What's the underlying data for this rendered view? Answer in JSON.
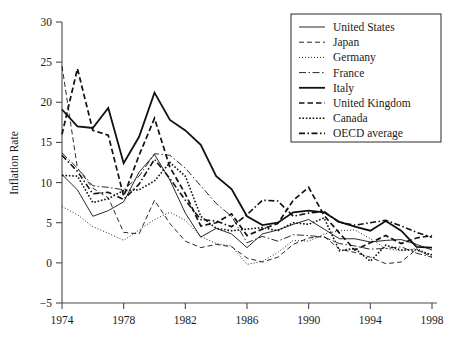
{
  "chart_data": {
    "type": "line",
    "title": "",
    "xlabel": "",
    "ylabel": "Inflation Rate",
    "xlim": [
      1974,
      1998
    ],
    "ylim": [
      -5,
      30
    ],
    "xticks": [
      1974,
      1978,
      1982,
      1986,
      1990,
      1994,
      1998
    ],
    "yticks": [
      -5,
      0,
      5,
      10,
      15,
      20,
      25,
      30
    ],
    "grid": false,
    "legend_position": "top-right",
    "x": [
      1974,
      1975,
      1976,
      1977,
      1978,
      1979,
      1980,
      1981,
      1982,
      1983,
      1984,
      1985,
      1986,
      1987,
      1988,
      1989,
      1990,
      1991,
      1992,
      1993,
      1994,
      1995,
      1996,
      1997,
      1998
    ],
    "series": [
      {
        "name": "United States",
        "style": "solid-thin",
        "stroke_width": 0.9,
        "dash": "none",
        "values": [
          11.0,
          9.1,
          5.8,
          6.5,
          7.6,
          11.3,
          13.5,
          10.3,
          6.2,
          3.2,
          4.3,
          3.6,
          1.9,
          3.6,
          4.1,
          4.8,
          5.4,
          4.2,
          3.0,
          3.0,
          2.6,
          2.8,
          2.9,
          2.3,
          1.6
        ]
      },
      {
        "name": "Japan",
        "style": "dashed-thin",
        "stroke_width": 0.9,
        "dash": "5,3",
        "values": [
          24.5,
          11.8,
          9.3,
          8.1,
          3.8,
          3.6,
          7.8,
          4.9,
          2.7,
          1.9,
          2.3,
          2.0,
          0.6,
          0.1,
          0.7,
          2.3,
          3.1,
          3.3,
          1.7,
          1.3,
          0.7,
          -0.1,
          0.1,
          1.7,
          0.7
        ]
      },
      {
        "name": "Germany",
        "style": "dotted-thin",
        "stroke_width": 0.9,
        "dash": "1,2",
        "values": [
          7.0,
          6.0,
          4.5,
          3.7,
          2.8,
          4.1,
          5.4,
          6.3,
          5.3,
          3.3,
          2.4,
          2.1,
          -0.2,
          0.2,
          1.3,
          2.8,
          2.7,
          3.6,
          4.0,
          4.1,
          3.0,
          1.8,
          1.5,
          1.8,
          0.9
        ]
      },
      {
        "name": "France",
        "style": "dash-dot-thin",
        "stroke_width": 0.9,
        "dash": "7,2.5,1.5,2.5",
        "values": [
          13.7,
          11.8,
          9.6,
          9.4,
          9.1,
          10.8,
          13.6,
          13.4,
          11.8,
          9.6,
          7.4,
          5.8,
          2.5,
          3.3,
          2.7,
          3.5,
          3.4,
          3.2,
          2.4,
          2.1,
          1.7,
          1.8,
          2.0,
          1.2,
          0.7
        ]
      },
      {
        "name": "Italy",
        "style": "solid-thick",
        "stroke_width": 1.8,
        "dash": "none",
        "values": [
          19.1,
          17.0,
          16.8,
          19.3,
          12.4,
          15.7,
          21.2,
          17.8,
          16.5,
          14.7,
          10.8,
          9.2,
          5.8,
          4.7,
          5.0,
          6.3,
          6.5,
          6.3,
          5.1,
          4.5,
          4.0,
          5.2,
          4.0,
          2.0,
          1.9
        ]
      },
      {
        "name": "United Kingdom",
        "style": "dashed-thick",
        "stroke_width": 1.7,
        "dash": "5.5,3",
        "values": [
          16.0,
          24.2,
          16.5,
          15.9,
          8.3,
          13.4,
          18.0,
          11.9,
          8.6,
          4.6,
          5.0,
          6.1,
          3.4,
          4.2,
          4.9,
          7.8,
          9.4,
          5.9,
          3.7,
          1.6,
          2.5,
          3.4,
          2.4,
          3.1,
          3.4
        ]
      },
      {
        "name": "Canada",
        "style": "dotted-thick",
        "stroke_width": 1.6,
        "dash": "1.6,1.8",
        "values": [
          10.9,
          10.8,
          7.5,
          8.0,
          9.0,
          9.1,
          10.2,
          12.5,
          10.8,
          5.8,
          4.3,
          4.0,
          4.2,
          4.4,
          4.0,
          5.0,
          4.8,
          5.6,
          1.5,
          1.8,
          0.2,
          2.2,
          1.6,
          1.6,
          1.0
        ]
      },
      {
        "name": "OECD average",
        "style": "dash-dot-thick",
        "stroke_width": 1.6,
        "dash": "6,2.5,1.5,2.5",
        "values": [
          13.4,
          11.4,
          8.6,
          8.8,
          7.9,
          9.8,
          12.9,
          10.5,
          7.8,
          5.4,
          5.2,
          4.5,
          6.0,
          7.8,
          7.7,
          5.8,
          6.2,
          6.4,
          5.0,
          4.7,
          5.0,
          5.3,
          4.6,
          3.8,
          3.2
        ]
      }
    ]
  },
  "legend": {
    "items": [
      {
        "label": "United States"
      },
      {
        "label": "Japan"
      },
      {
        "label": "Germany"
      },
      {
        "label": "France"
      },
      {
        "label": "Italy"
      },
      {
        "label": "United Kingdom"
      },
      {
        "label": "Canada"
      },
      {
        "label": "OECD average"
      }
    ]
  }
}
